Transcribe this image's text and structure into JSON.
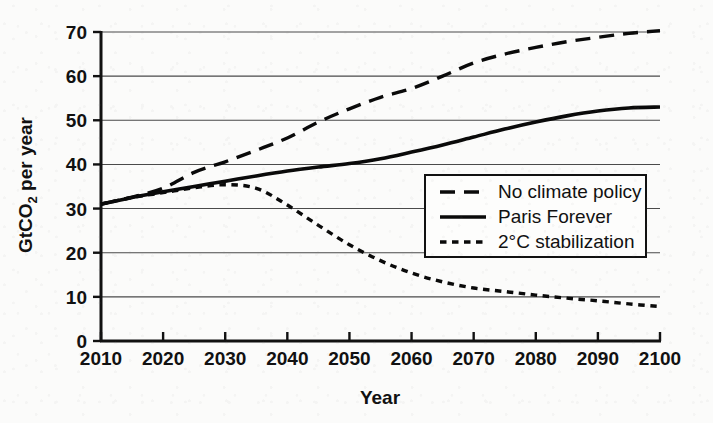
{
  "chart_data": {
    "type": "line",
    "title": "",
    "xlabel": "Year",
    "ylabel_parts": {
      "pre": "GtCO",
      "sub": "2",
      "post": " per year"
    },
    "ylabel": "GtCO2 per year",
    "grid": true,
    "legend_position": "center-right",
    "xlim": [
      2010,
      2100
    ],
    "ylim": [
      0,
      70
    ],
    "xticks": [
      2010,
      2020,
      2030,
      2040,
      2050,
      2060,
      2070,
      2080,
      2090,
      2100
    ],
    "xtick_labels": [
      "2010",
      "2020",
      "2030",
      "2040",
      "2050",
      "2060",
      "2070",
      "2080",
      "2090",
      "2100"
    ],
    "yticks": [
      0,
      10,
      20,
      30,
      40,
      50,
      60,
      70
    ],
    "ytick_labels": [
      "0",
      "10",
      "20",
      "30",
      "40",
      "50",
      "60",
      "70"
    ],
    "x": [
      2010,
      2015,
      2020,
      2025,
      2030,
      2035,
      2040,
      2045,
      2050,
      2055,
      2060,
      2065,
      2070,
      2075,
      2080,
      2085,
      2090,
      2095,
      2100
    ],
    "series": [
      {
        "name": "No climate policy",
        "style": "long-dash",
        "color": "#0a0a0a",
        "values": [
          31.0,
          32.6,
          34.6,
          38.2,
          40.6,
          43.2,
          46.0,
          49.6,
          52.6,
          55.2,
          57.2,
          60.0,
          63.0,
          65.0,
          66.5,
          67.8,
          68.8,
          69.7,
          70.3
        ]
      },
      {
        "name": "Paris Forever",
        "style": "solid",
        "color": "#0a0a0a",
        "values": [
          31.0,
          32.5,
          33.8,
          35.0,
          36.2,
          37.4,
          38.5,
          39.4,
          40.2,
          41.3,
          42.8,
          44.4,
          46.2,
          48.0,
          49.6,
          51.0,
          52.1,
          52.8,
          53.0
        ]
      },
      {
        "name": "2°C stabilization",
        "style": "short-dash",
        "color": "#0a0a0a",
        "values": [
          31.0,
          32.5,
          33.6,
          34.7,
          35.4,
          34.6,
          30.8,
          26.2,
          21.8,
          18.2,
          15.4,
          13.4,
          12.0,
          11.2,
          10.4,
          9.7,
          9.1,
          8.4,
          7.8
        ]
      }
    ],
    "legend_entries": [
      {
        "label": "No climate policy",
        "style": "long-dash"
      },
      {
        "label": "Paris Forever",
        "style": "solid"
      },
      {
        "label": "2°C stabilization",
        "style": "short-dash"
      }
    ]
  }
}
